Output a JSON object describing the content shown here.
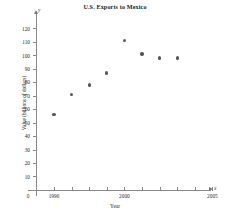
{
  "chart_data": {
    "type": "scatter",
    "title": "U.S. Exports to Mexico",
    "xlabel": "Year",
    "ylabel": "Value (billions of dollars)",
    "x_axis_letter": "x",
    "y_axis_letter": "y",
    "origin_label": "0",
    "xlim": [
      1995,
      2006
    ],
    "ylim": [
      0,
      125
    ],
    "grid": false,
    "legend": null,
    "x_tick_values": [
      1996,
      1997,
      1998,
      1999,
      2000,
      2001,
      2002,
      2003,
      2004,
      2005
    ],
    "x_tick_labels": [
      "1996",
      "",
      "",
      "",
      "2000",
      "",
      "",
      "",
      "",
      "2005"
    ],
    "y_tick_values": [
      10,
      20,
      30,
      40,
      50,
      60,
      70,
      80,
      90,
      100,
      110,
      120
    ],
    "y_tick_labels": [
      "10",
      "20",
      "30",
      "40",
      "50",
      "60",
      "70",
      "80",
      "90",
      "100",
      "110",
      "120"
    ],
    "x": [
      1996,
      1997,
      1998,
      1999,
      2000,
      2001,
      2002,
      2003
    ],
    "points": [
      {
        "x": 1996,
        "y": 56
      },
      {
        "x": 1997,
        "y": 71
      },
      {
        "x": 1998,
        "y": 78
      },
      {
        "x": 1999,
        "y": 87
      },
      {
        "x": 2000,
        "y": 111
      },
      {
        "x": 2001,
        "y": 101
      },
      {
        "x": 2002,
        "y": 98
      },
      {
        "x": 2003,
        "y": 98
      }
    ],
    "values": [
      56,
      71,
      78,
      87,
      111,
      101,
      98,
      98
    ],
    "marker_color": "#585858",
    "axis_color": "#8a8a8a"
  }
}
